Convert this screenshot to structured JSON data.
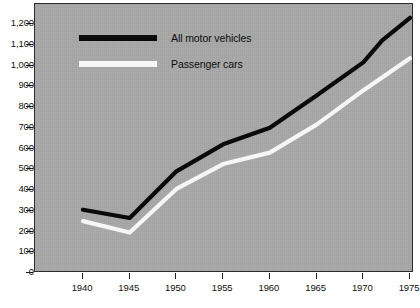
{
  "chart_data": {
    "type": "line",
    "title": "",
    "subtitle": "",
    "xlabel": "",
    "ylabel": "",
    "xlim": [
      1938,
      1976
    ],
    "ylim": [
      0,
      1250
    ],
    "grid": false,
    "legend_position": "top-left-inside",
    "x_ticks": [
      "1940",
      "1945",
      "1950",
      "1955",
      "1960",
      "1965",
      "1970",
      "1975"
    ],
    "x_tick_values": [
      1940,
      1945,
      1950,
      1955,
      1960,
      1965,
      1970,
      1975
    ],
    "y_ticks": [
      "0",
      "100",
      "200",
      "300",
      "400",
      "500",
      "600",
      "700",
      "800",
      "900",
      "1,000",
      "1,100",
      "1,200"
    ],
    "y_tick_values": [
      0,
      100,
      200,
      300,
      400,
      500,
      600,
      700,
      800,
      900,
      1000,
      1100,
      1200
    ],
    "series": [
      {
        "name": "All motor vehicles",
        "color": "#0a0a0a",
        "x": [
          1940,
          1945,
          1950,
          1955,
          1960,
          1965,
          1970,
          1972,
          1975
        ],
        "values": [
          305,
          265,
          490,
          620,
          700,
          855,
          1015,
          1120,
          1230
        ]
      },
      {
        "name": "Passenger cars",
        "color": "#f6f6f6",
        "x": [
          1940,
          1945,
          1950,
          1955,
          1960,
          1965,
          1970,
          1975
        ],
        "values": [
          250,
          195,
          405,
          525,
          580,
          715,
          880,
          1035
        ]
      }
    ]
  },
  "legend": {
    "entries": [
      {
        "label": "All motor vehicles",
        "swatch": "black-line-swatch"
      },
      {
        "label": "Passenger cars",
        "swatch": "white-line-swatch"
      }
    ]
  },
  "colors": {
    "plot_background": "#a9a9a9",
    "page_background": "#ffffff",
    "axis": "#1c1c1c",
    "series_all_motor_vehicles": "#0a0a0a",
    "series_passenger_cars": "#f6f6f6"
  }
}
